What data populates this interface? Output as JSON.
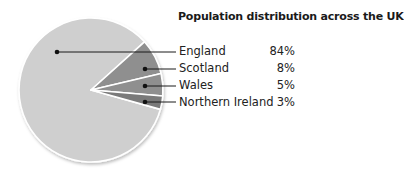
{
  "chart_data": {
    "type": "pie",
    "title": "Population distribution across the UK",
    "categories": [
      "England",
      "Scotland",
      "Wales",
      "Northern Ireland"
    ],
    "values": [
      84,
      8,
      5,
      3
    ],
    "value_labels": [
      "84%",
      "8%",
      "5%",
      "3%"
    ],
    "colors": [
      "#cfcfcf",
      "#8f8f8f",
      "#8f8f8f",
      "#7a7a7a"
    ],
    "legend_position": "right"
  },
  "legend": {
    "items": [
      {
        "label": "England",
        "value": "84%"
      },
      {
        "label": "Scotland",
        "value": "8%"
      },
      {
        "label": "Wales",
        "value": "5%"
      },
      {
        "label": "Northern Ireland",
        "value": "3%"
      }
    ]
  }
}
